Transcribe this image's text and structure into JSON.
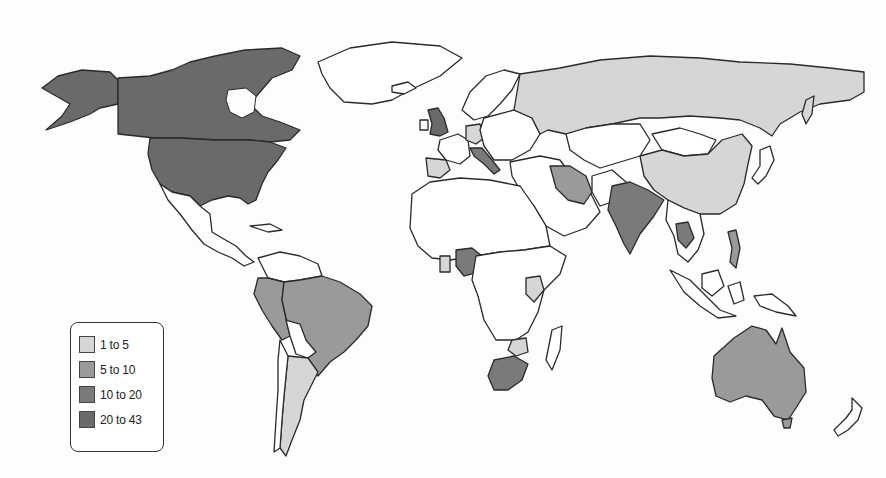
{
  "map": {
    "type": "choropleth-world-map",
    "colors": {
      "background": "#fdfdfd",
      "border": "#2a2a2a",
      "no_data": "#ffffff"
    }
  },
  "legend": {
    "items": [
      {
        "label": "1 to 5",
        "color": "#d6d6d6"
      },
      {
        "label": "5 to 10",
        "color": "#9a9a9a"
      },
      {
        "label": "10 to 20",
        "color": "#7a7a7a"
      },
      {
        "label": "20 to 43",
        "color": "#6a6a6a"
      }
    ]
  },
  "regions": {
    "20_to_43": [
      "Canada",
      "United States",
      "Alaska",
      "United Kingdom"
    ],
    "10_to_20": [
      "India",
      "Nigeria",
      "South Africa",
      "Italy",
      "Thailand",
      "Netherlands"
    ],
    "5_to_10": [
      "Brazil",
      "Peru",
      "Australia",
      "Iran",
      "Philippines",
      "Colombia"
    ],
    "1_to_5": [
      "Russia",
      "China",
      "Argentina",
      "Germany",
      "Spain",
      "Kenya",
      "Zimbabwe",
      "Ghana",
      "Sakhalin"
    ]
  }
}
